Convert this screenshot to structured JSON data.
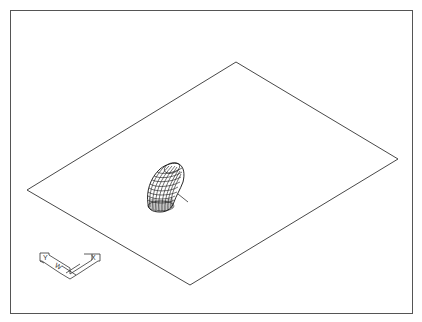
{
  "viewport": {
    "kind": "cad-drawing-viewport",
    "border_color": "#555555",
    "background": "#ffffff"
  },
  "scene": {
    "plane": {
      "vertices": [
        [
          236,
          62
        ],
        [
          398,
          159
        ],
        [
          190,
          285
        ],
        [
          27,
          190
        ]
      ],
      "stroke": "#333333"
    },
    "elbow": {
      "label": "pipe-elbow-wireframe",
      "bbox": [
        146,
        163,
        184,
        212
      ],
      "axis_line": [
        [
          178,
          194
        ],
        [
          188,
          202
        ]
      ]
    }
  },
  "ucs_icon": {
    "y_label": "Y",
    "w_label": "W",
    "x_label": "X"
  }
}
